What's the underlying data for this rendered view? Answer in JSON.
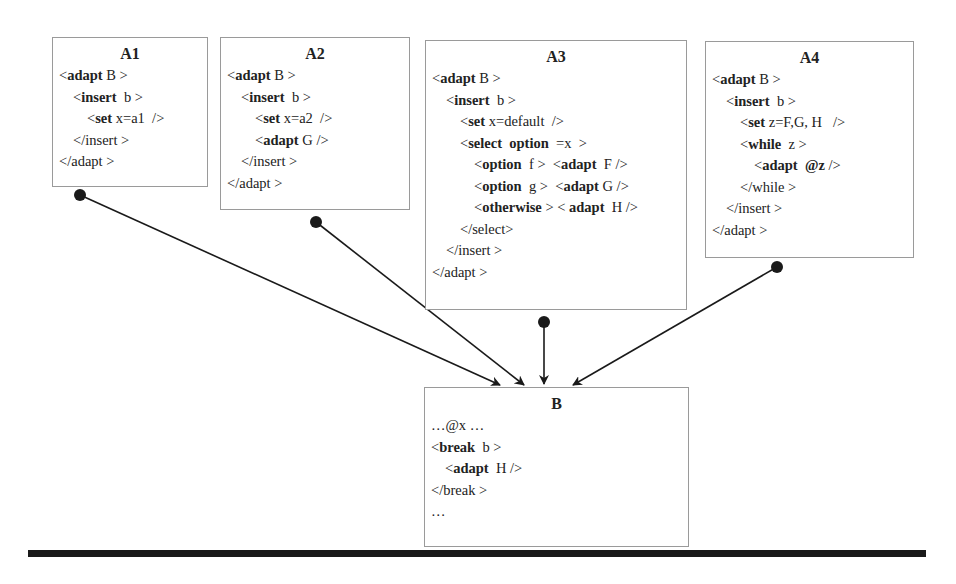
{
  "boxes": {
    "A1": {
      "title": "A1",
      "lines": [
        {
          "indent": 0,
          "parts": [
            {
              "t": "<",
              "b": false
            },
            {
              "t": "adapt",
              "b": true
            },
            {
              "t": " B >",
              "b": false
            }
          ]
        },
        {
          "indent": 1,
          "parts": [
            {
              "t": "<",
              "b": false
            },
            {
              "t": "insert",
              "b": true
            },
            {
              "t": "  b >",
              "b": false
            }
          ]
        },
        {
          "indent": 2,
          "parts": [
            {
              "t": "<",
              "b": false
            },
            {
              "t": "set",
              "b": true
            },
            {
              "t": " x=a1  />",
              "b": false
            }
          ]
        },
        {
          "indent": 1,
          "parts": [
            {
              "t": "</insert >",
              "b": false
            }
          ]
        },
        {
          "indent": 0,
          "parts": [
            {
              "t": "</adapt >",
              "b": false
            }
          ]
        }
      ]
    },
    "A2": {
      "title": "A2",
      "lines": [
        {
          "indent": 0,
          "parts": [
            {
              "t": "<",
              "b": false
            },
            {
              "t": "adapt",
              "b": true
            },
            {
              "t": " B >",
              "b": false
            }
          ]
        },
        {
          "indent": 1,
          "parts": [
            {
              "t": "<",
              "b": false
            },
            {
              "t": "insert",
              "b": true
            },
            {
              "t": "  b >",
              "b": false
            }
          ]
        },
        {
          "indent": 2,
          "parts": [
            {
              "t": "<",
              "b": false
            },
            {
              "t": "set",
              "b": true
            },
            {
              "t": " x=a2  />",
              "b": false
            }
          ]
        },
        {
          "indent": 2,
          "parts": [
            {
              "t": "<",
              "b": false
            },
            {
              "t": "adapt",
              "b": true
            },
            {
              "t": " G />",
              "b": false
            }
          ]
        },
        {
          "indent": 1,
          "parts": [
            {
              "t": "</insert >",
              "b": false
            }
          ]
        },
        {
          "indent": 0,
          "parts": [
            {
              "t": "</adapt >",
              "b": false
            }
          ]
        }
      ]
    },
    "A3": {
      "title": "A3",
      "lines": [
        {
          "indent": 0,
          "parts": [
            {
              "t": "<",
              "b": false
            },
            {
              "t": "adapt",
              "b": true
            },
            {
              "t": " B >",
              "b": false
            }
          ]
        },
        {
          "indent": 1,
          "parts": [
            {
              "t": "<",
              "b": false
            },
            {
              "t": "insert",
              "b": true
            },
            {
              "t": "  b >",
              "b": false
            }
          ]
        },
        {
          "indent": 2,
          "parts": [
            {
              "t": "<",
              "b": false
            },
            {
              "t": "set",
              "b": true
            },
            {
              "t": " x=default  />",
              "b": false
            }
          ]
        },
        {
          "indent": 2,
          "parts": [
            {
              "t": "<",
              "b": false
            },
            {
              "t": "select  option",
              "b": true
            },
            {
              "t": "  =x  >",
              "b": false
            }
          ]
        },
        {
          "indent": 3,
          "parts": [
            {
              "t": "<",
              "b": false
            },
            {
              "t": "option",
              "b": true
            },
            {
              "t": "  f >  <",
              "b": false
            },
            {
              "t": "adapt",
              "b": true
            },
            {
              "t": "  F />",
              "b": false
            }
          ]
        },
        {
          "indent": 3,
          "parts": [
            {
              "t": "<",
              "b": false
            },
            {
              "t": "option",
              "b": true
            },
            {
              "t": "  g >  <",
              "b": false
            },
            {
              "t": "adapt",
              "b": true
            },
            {
              "t": " G />",
              "b": false
            }
          ]
        },
        {
          "indent": 3,
          "parts": [
            {
              "t": "<",
              "b": false
            },
            {
              "t": "otherwise",
              "b": true
            },
            {
              "t": " > < ",
              "b": false
            },
            {
              "t": "adapt",
              "b": true
            },
            {
              "t": "  H />",
              "b": false
            }
          ]
        },
        {
          "indent": 2,
          "parts": [
            {
              "t": "</select>",
              "b": false
            }
          ]
        },
        {
          "indent": 1,
          "parts": [
            {
              "t": "</insert >",
              "b": false
            }
          ]
        },
        {
          "indent": 0,
          "parts": [
            {
              "t": "</adapt >",
              "b": false
            }
          ]
        }
      ]
    },
    "A4": {
      "title": "A4",
      "lines": [
        {
          "indent": 0,
          "parts": [
            {
              "t": "<",
              "b": false
            },
            {
              "t": "adapt",
              "b": true
            },
            {
              "t": " B >",
              "b": false
            }
          ]
        },
        {
          "indent": 1,
          "parts": [
            {
              "t": "<",
              "b": false
            },
            {
              "t": "insert",
              "b": true
            },
            {
              "t": "  b >",
              "b": false
            }
          ]
        },
        {
          "indent": 2,
          "parts": [
            {
              "t": "<",
              "b": false
            },
            {
              "t": "set",
              "b": true
            },
            {
              "t": " z=F,G, H   />",
              "b": false
            }
          ]
        },
        {
          "indent": 2,
          "parts": [
            {
              "t": "<",
              "b": false
            },
            {
              "t": "while",
              "b": true
            },
            {
              "t": "  z >",
              "b": false
            }
          ]
        },
        {
          "indent": 3,
          "parts": [
            {
              "t": "<",
              "b": false
            },
            {
              "t": "adapt  @z",
              "b": true
            },
            {
              "t": " />",
              "b": false
            }
          ]
        },
        {
          "indent": 2,
          "parts": [
            {
              "t": "</while >",
              "b": false
            }
          ]
        },
        {
          "indent": 1,
          "parts": [
            {
              "t": "</insert >",
              "b": false
            }
          ]
        },
        {
          "indent": 0,
          "parts": [
            {
              "t": "</adapt >",
              "b": false
            }
          ]
        }
      ]
    },
    "B": {
      "title": "B",
      "lines": [
        {
          "indent": 0,
          "parts": [
            {
              "t": "…@x …",
              "b": false
            }
          ]
        },
        {
          "indent": 0,
          "parts": [
            {
              "t": "<",
              "b": false
            },
            {
              "t": "break",
              "b": true
            },
            {
              "t": "  b >",
              "b": false
            }
          ]
        },
        {
          "indent": 1,
          "parts": [
            {
              "t": "<",
              "b": false
            },
            {
              "t": "adapt",
              "b": true
            },
            {
              "t": "  H />",
              "b": false
            }
          ]
        },
        {
          "indent": 0,
          "parts": [
            {
              "t": "</break >",
              "b": false
            }
          ]
        },
        {
          "indent": 0,
          "parts": [
            {
              "t": "…",
              "b": false
            }
          ]
        }
      ]
    }
  },
  "connections": [
    {
      "from": "A1",
      "to": "B",
      "label": "A1 adapts B"
    },
    {
      "from": "A2",
      "to": "B",
      "label": "A2 adapts B"
    },
    {
      "from": "A3",
      "to": "B",
      "label": "A3 adapts B"
    },
    {
      "from": "A4",
      "to": "B",
      "label": "A4 adapts B"
    }
  ],
  "colors": {
    "box_border": "#9a9a9a",
    "arrow": "#1a1a1a",
    "bar": "#1a1a1a"
  }
}
